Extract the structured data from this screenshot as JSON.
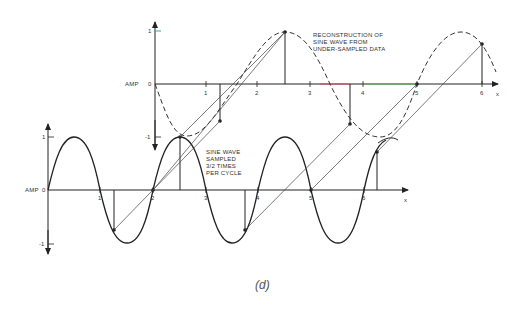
{
  "figure": {
    "caption": "(d)",
    "top_plot": {
      "y_axis_label": "AMP",
      "y_ticks": [
        "1",
        "0",
        "-1"
      ],
      "x_ticks": [
        "1",
        "2",
        "3",
        "4",
        "5",
        "6"
      ],
      "x_axis_end_label": "x",
      "annotation": [
        "RECONSTRUCTION OF",
        "SINE WAVE FROM",
        "UNDER-SAMPLED DATA"
      ],
      "curve_style": "dashed",
      "axis_highlight_colors": {
        "red": "#d9546a",
        "green": "#5cb85c",
        "teal": "#3aa6a0"
      }
    },
    "bottom_plot": {
      "y_axis_label": "AMP",
      "y_ticks": [
        "1",
        "0",
        "-1"
      ],
      "x_ticks": [
        "1",
        "2",
        "3",
        "4",
        "5",
        "6"
      ],
      "x_axis_end_label": "x",
      "annotation": [
        "SINE WAVE",
        "SAMPLED",
        "3/2 TIMES",
        "PER CYCLE"
      ],
      "curve_style": "solid"
    }
  }
}
